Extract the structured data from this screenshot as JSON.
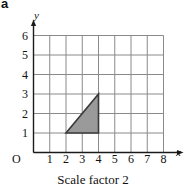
{
  "figure": {
    "part_label": "a",
    "caption": "Scale factor 2",
    "axis_names": {
      "x": "x",
      "y": "y"
    },
    "origin_label": "O",
    "x_ticks": [
      "1",
      "2",
      "3",
      "4",
      "5",
      "6",
      "7",
      "8"
    ],
    "y_ticks": [
      "1",
      "2",
      "3",
      "4",
      "5",
      "6"
    ]
  },
  "chart_data": {
    "type": "scatter",
    "title": "",
    "subtitle": "Scale factor 2",
    "xlabel": "x",
    "ylabel": "y",
    "xlim": [
      0,
      8
    ],
    "ylim": [
      0,
      6
    ],
    "xticks": [
      0,
      1,
      2,
      3,
      4,
      5,
      6,
      7,
      8
    ],
    "yticks": [
      0,
      1,
      2,
      3,
      4,
      5,
      6
    ],
    "grid": true,
    "grid_spacing": 1,
    "legend": "none",
    "shapes": [
      {
        "name": "shaded-triangle",
        "kind": "polygon",
        "vertices": [
          [
            2,
            1
          ],
          [
            4,
            1
          ],
          [
            4,
            3
          ]
        ],
        "fill": "#9a9a9a",
        "stroke": "#3a3a3a"
      }
    ],
    "annotations": []
  },
  "colors": {
    "grid_line": "#8a8a8a",
    "axis_line": "#1a1a1a",
    "triangle_fill": "#9a9a9a",
    "triangle_stroke": "#3a3a3a",
    "text": "#111111",
    "background": "#ffffff"
  }
}
